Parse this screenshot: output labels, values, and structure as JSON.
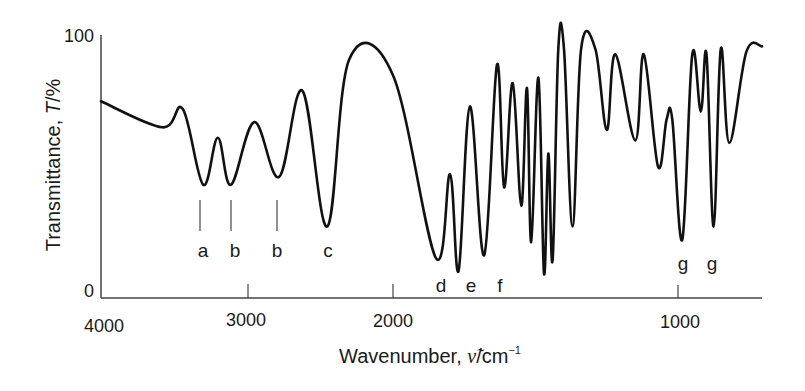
{
  "chart_data": {
    "type": "line",
    "title": "",
    "xlabel": "Wavenumber, ν̃/cm⁻¹",
    "xlabel_parts": {
      "main": "Wavenumber, ",
      "symbol": "ν̃",
      "unit": "/cm",
      "sup": "−1"
    },
    "ylabel": "Transmittance, T/%",
    "ylabel_parts": {
      "main": "Transmittance, ",
      "symbol": "T",
      "unit": "/%"
    },
    "xlim": [
      4000,
      700
    ],
    "x_reversed": true,
    "x_scale_note": "scale expands below 2000 cm-1",
    "ylim": [
      0,
      100
    ],
    "grid": false,
    "legend": null,
    "x_ticks": [
      {
        "value": 4000,
        "label": "4000",
        "px": 101
      },
      {
        "value": 3000,
        "label": "3000",
        "px": 248
      },
      {
        "value": 2000,
        "label": "2000",
        "px": 393
      },
      {
        "value": 1000,
        "label": "1000",
        "px": 678
      }
    ],
    "y_ticks": [
      {
        "value": 100,
        "label": "100"
      },
      {
        "value": 0,
        "label": "0"
      }
    ],
    "series": [
      {
        "name": "IR spectrum",
        "color": "#111111",
        "x": [
          4000,
          3580,
          3440,
          3300,
          3200,
          3110,
          2950,
          2780,
          2620,
          2450,
          2300,
          2000,
          1850,
          1800,
          1770,
          1730,
          1680,
          1635,
          1610,
          1580,
          1550,
          1530,
          1515,
          1490,
          1470,
          1455,
          1440,
          1420,
          1400,
          1370,
          1340,
          1290,
          1250,
          1220,
          1150,
          1120,
          1070,
          1040,
          1020,
          985,
          950,
          920,
          900,
          875,
          850,
          820,
          760,
          705
        ],
        "values": [
          75,
          65,
          72,
          43,
          61,
          43,
          67,
          46,
          79,
          27,
          91,
          85,
          15,
          47,
          10,
          73,
          16,
          89,
          42,
          82,
          35,
          80,
          21,
          84,
          9,
          55,
          14,
          95,
          95,
          27,
          95,
          95,
          64,
          93,
          60,
          93,
          50,
          68,
          68,
          22,
          93,
          71,
          93,
          27,
          95,
          59,
          94,
          96
        ]
      }
    ],
    "annotations": [
      {
        "label": "a",
        "x": 3300,
        "marker": true
      },
      {
        "label": "b",
        "x": 3100,
        "marker": true
      },
      {
        "label": "b",
        "x": 2790,
        "marker": true
      },
      {
        "label": "c",
        "x": 2450,
        "marker": false
      },
      {
        "label": "d",
        "x": 1800,
        "marker": false
      },
      {
        "label": "e",
        "x": 1730,
        "marker": false
      },
      {
        "label": "f",
        "x": 1640,
        "marker": false
      },
      {
        "label": "g",
        "x": 995,
        "marker": false
      },
      {
        "label": "g",
        "x": 890,
        "marker": false
      }
    ]
  },
  "labels": {
    "y_top": "100",
    "y_bottom": "0",
    "x_4000": "4000",
    "x_3000": "3000",
    "x_2000": "2000",
    "x_1000": "1000",
    "peak_a": "a",
    "peak_b1": "b",
    "peak_b2": "b",
    "peak_c": "c",
    "peak_d": "d",
    "peak_e": "e",
    "peak_f": "f",
    "peak_g1": "g",
    "peak_g2": "g",
    "ylabel_main": "Transmittance, ",
    "ylabel_symbol": "T",
    "ylabel_unit": "/%",
    "xlabel_main": "Wavenumber, ",
    "xlabel_symbol": "ν̃",
    "xlabel_unit": "/cm",
    "xlabel_sup": "−1"
  }
}
